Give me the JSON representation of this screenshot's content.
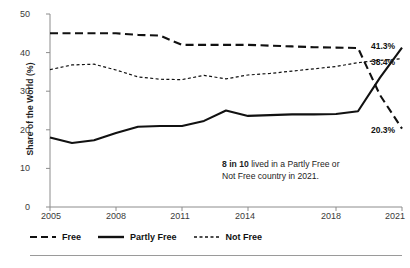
{
  "chart_data": {
    "type": "line",
    "title": "",
    "xlabel": "",
    "ylabel": "Share of the World (%)",
    "xlim": [
      2005,
      2021
    ],
    "ylim": [
      0,
      50
    ],
    "grid": false,
    "legend_position": "bottom-left",
    "x": [
      2005,
      2006,
      2007,
      2008,
      2009,
      2010,
      2011,
      2012,
      2013,
      2014,
      2015,
      2016,
      2017,
      2018,
      2019,
      2020,
      2021
    ],
    "xticks": [
      "2005",
      "2008",
      "2011",
      "2014",
      "2018",
      "2021"
    ],
    "xtick_values": [
      2005,
      2008,
      2011,
      2014,
      2018,
      2021
    ],
    "yticks": [
      "0",
      "10",
      "20",
      "30",
      "40",
      "50"
    ],
    "ytick_values": [
      0,
      10,
      20,
      30,
      40,
      50
    ],
    "series": [
      {
        "name": "Free",
        "style": "dashed",
        "end_label": "20.3%",
        "end_value": 20.3,
        "values": [
          45.0,
          45.0,
          45.0,
          45.0,
          44.6,
          44.4,
          42.0,
          42.0,
          42.0,
          42.0,
          41.8,
          41.6,
          41.4,
          41.3,
          41.2,
          29.0,
          20.3
        ]
      },
      {
        "name": "Partly Free",
        "style": "solid",
        "end_label": "41.3%",
        "end_value": 41.3,
        "values": [
          18.0,
          16.6,
          17.3,
          19.2,
          20.8,
          21.0,
          21.0,
          22.3,
          25.0,
          23.6,
          23.8,
          24.0,
          24.0,
          24.1,
          24.8,
          33.5,
          41.3
        ]
      },
      {
        "name": "Not Free",
        "style": "dotted",
        "end_label": "38.4%",
        "end_value": 38.4,
        "values": [
          35.6,
          36.8,
          37.0,
          35.5,
          33.7,
          33.1,
          33.0,
          34.1,
          33.2,
          34.2,
          34.6,
          35.2,
          35.8,
          36.4,
          37.4,
          38.0,
          38.4
        ]
      }
    ],
    "annotation": {
      "bold_text": "8 in 10",
      "rest_line1": " lived in a Partly Free or",
      "line2": "Not Free country in 2021."
    }
  },
  "legend": {
    "items": [
      {
        "label": "Free",
        "key": "dashed-line-key"
      },
      {
        "label": "Partly Free",
        "key": "solid-line-key"
      },
      {
        "label": "Not Free",
        "key": "dotted-line-key"
      }
    ]
  },
  "colors": {
    "line": "#111111",
    "axis": "#8c8c8c",
    "text": "#1d1d1d",
    "rule": "#9a9a9a"
  }
}
